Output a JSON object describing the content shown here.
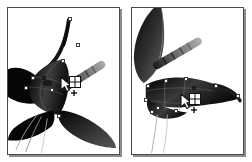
{
  "figure": {
    "panel_count": 2,
    "background_color": "#ffffff",
    "frame_color": "#4a4a4a",
    "shadow_color": "#8d8d8d"
  },
  "panels": [
    {
      "id": "panel-left",
      "label": "Before mesh point added",
      "caption": "",
      "subject": "butterfly-moth-body-and-wings",
      "orientation": "upright",
      "cursor": {
        "name": "mesh-tool-cursor",
        "glyph": "arrow-with-grid",
        "x": 52,
        "y": 75,
        "grid_rows": 2,
        "grid_cols": 2,
        "modifier": "plus"
      },
      "anchors": [
        {
          "x": 62,
          "y": 11,
          "type": "hollow"
        },
        {
          "x": 70,
          "y": 37,
          "type": "hollow"
        },
        {
          "x": 55,
          "y": 53,
          "type": "hollow"
        },
        {
          "x": 25,
          "y": 70,
          "type": "hollow"
        },
        {
          "x": 18,
          "y": 80,
          "type": "hollow"
        },
        {
          "x": 44,
          "y": 82,
          "type": "hollow"
        },
        {
          "x": 51,
          "y": 108,
          "type": "hollow"
        },
        {
          "x": 41,
          "y": 76,
          "type": "solid"
        },
        {
          "x": 36,
          "y": 70,
          "type": "solid"
        }
      ],
      "elements": {
        "antenna": {
          "name": "striped-antenna",
          "angle": -32,
          "stripes": 5
        },
        "upper_wing": {
          "name": "upper-wing",
          "fill": "dark-gradient"
        },
        "lower_wing": {
          "name": "lower-wing",
          "fill": "dark-gradient"
        },
        "body": {
          "name": "insect-body",
          "fill": "dark-gradient"
        },
        "legs": {
          "name": "thin-legs",
          "count": 3
        }
      }
    },
    {
      "id": "panel-right",
      "label": "After mesh point added",
      "caption": "",
      "subject": "butterfly-moth-body-and-wings",
      "orientation": "rotated",
      "cursor": {
        "name": "mesh-tool-cursor",
        "glyph": "arrow-with-grid",
        "x": 50,
        "y": 92,
        "grid_rows": 2,
        "grid_cols": 2,
        "modifier": "plus"
      },
      "anchors": [
        {
          "x": 16,
          "y": 78,
          "type": "hollow"
        },
        {
          "x": 34,
          "y": 73,
          "type": "hollow"
        },
        {
          "x": 54,
          "y": 71,
          "type": "hollow"
        },
        {
          "x": 84,
          "y": 78,
          "type": "hollow"
        },
        {
          "x": 106,
          "y": 88,
          "type": "hollow"
        },
        {
          "x": 14,
          "y": 92,
          "type": "hollow"
        },
        {
          "x": 26,
          "y": 100,
          "type": "hollow"
        },
        {
          "x": 44,
          "y": 103,
          "type": "hollow"
        },
        {
          "x": 20,
          "y": 104,
          "type": "hollow"
        },
        {
          "x": 62,
          "y": 80,
          "type": "solid"
        }
      ],
      "elements": {
        "antenna": {
          "name": "striped-antenna",
          "angle": -30,
          "stripes": 5
        },
        "upper_wing": {
          "name": "upper-wing",
          "fill": "dark-gradient"
        },
        "lower_wing": {
          "name": "lower-wing",
          "fill": "dark-gradient"
        },
        "body": {
          "name": "insect-body",
          "fill": "dark-gradient"
        },
        "legs": {
          "name": "thin-legs",
          "count": 2
        }
      }
    }
  ],
  "colors": {
    "ink_black": "#101010",
    "mid_gray": "#6e6e6e",
    "light_gray": "#b9b9b9",
    "anchor_fill": "#ffffff",
    "anchor_stroke": "#3c3c3c"
  }
}
